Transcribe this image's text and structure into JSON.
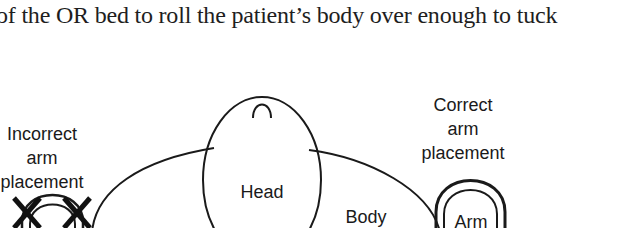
{
  "body_text": "of the OR bed to roll the patient’s body over enough to tuck",
  "diagram": {
    "incorrect_label": [
      "Incorrect",
      "arm",
      "placement"
    ],
    "correct_label": [
      "Correct",
      "arm",
      "placement"
    ],
    "head_label": "Head",
    "body_label": "Body",
    "arm_label": "Arm",
    "icons": {
      "incorrect_marker": "x-mark-icon"
    },
    "stroke_color": "#1a1a1a"
  }
}
